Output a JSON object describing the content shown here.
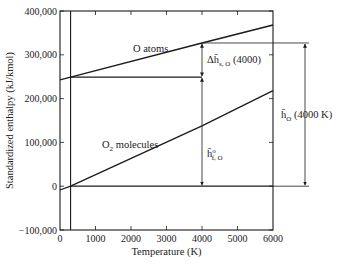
{
  "chart_data": {
    "type": "line",
    "title": "",
    "xlabel": "Temperature (K)",
    "ylabel": "Standardized enthalpy (kJ/kmol)",
    "xlim": [
      0,
      6000
    ],
    "ylim": [
      -100000,
      400000
    ],
    "xticks": [
      0,
      1000,
      2000,
      3000,
      4000,
      5000,
      6000
    ],
    "xtick_labels": [
      "0",
      "1000",
      "2000",
      "3000",
      "4000",
      "5000",
      "6000"
    ],
    "yticks": [
      -100000,
      0,
      100000,
      200000,
      300000,
      400000
    ],
    "ytick_labels": [
      "-100,000",
      "0",
      "100,000",
      "200,000",
      "300,000",
      "400,000"
    ],
    "grid": false,
    "reference_temperature": 298,
    "series": [
      {
        "name": "O atoms",
        "x": [
          0,
          298,
          4000,
          6000
        ],
        "y": [
          243000,
          249170,
          327000,
          368000
        ]
      },
      {
        "name": "O2 molecules",
        "x": [
          0,
          298,
          4000,
          6000
        ],
        "y": [
          -8700,
          0,
          138000,
          218000
        ]
      }
    ],
    "reference_lines": [
      {
        "name": "O formation level",
        "y": 249170,
        "x_from": 298,
        "x_to": 4000
      },
      {
        "name": "zero level",
        "y": 0,
        "x_from": 298,
        "x_to": 6000
      }
    ],
    "annotations": [
      {
        "name": "o-atoms-label",
        "text": "O atoms"
      },
      {
        "name": "o2-label-main",
        "text": "O",
        "sub": "2",
        "rest": " molecules"
      },
      {
        "name": "delta-h-label",
        "text": "Δh̄",
        "sub": "s, O",
        "rest": " (4000)"
      },
      {
        "name": "hf-label",
        "text": "h̄",
        "sup": "o",
        "sub": "f, O"
      },
      {
        "name": "h-total-label",
        "text": "h̄",
        "sub": "O",
        "rest": " (4000 K)"
      }
    ]
  }
}
